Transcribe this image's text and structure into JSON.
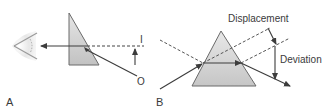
{
  "figure": {
    "panel_a": {
      "label": "A",
      "image_label": "I",
      "object_label": "O"
    },
    "panel_b": {
      "label": "B",
      "displacement_label": "Displacement",
      "deviation_label": "Deviation"
    }
  },
  "colors": {
    "line": "#3c3c3c",
    "prism_fill_top": "#e2e2e2",
    "prism_fill_bottom": "#c4c4c4",
    "prism_stroke": "#666666",
    "eye_shade": "#d8d8d8"
  }
}
